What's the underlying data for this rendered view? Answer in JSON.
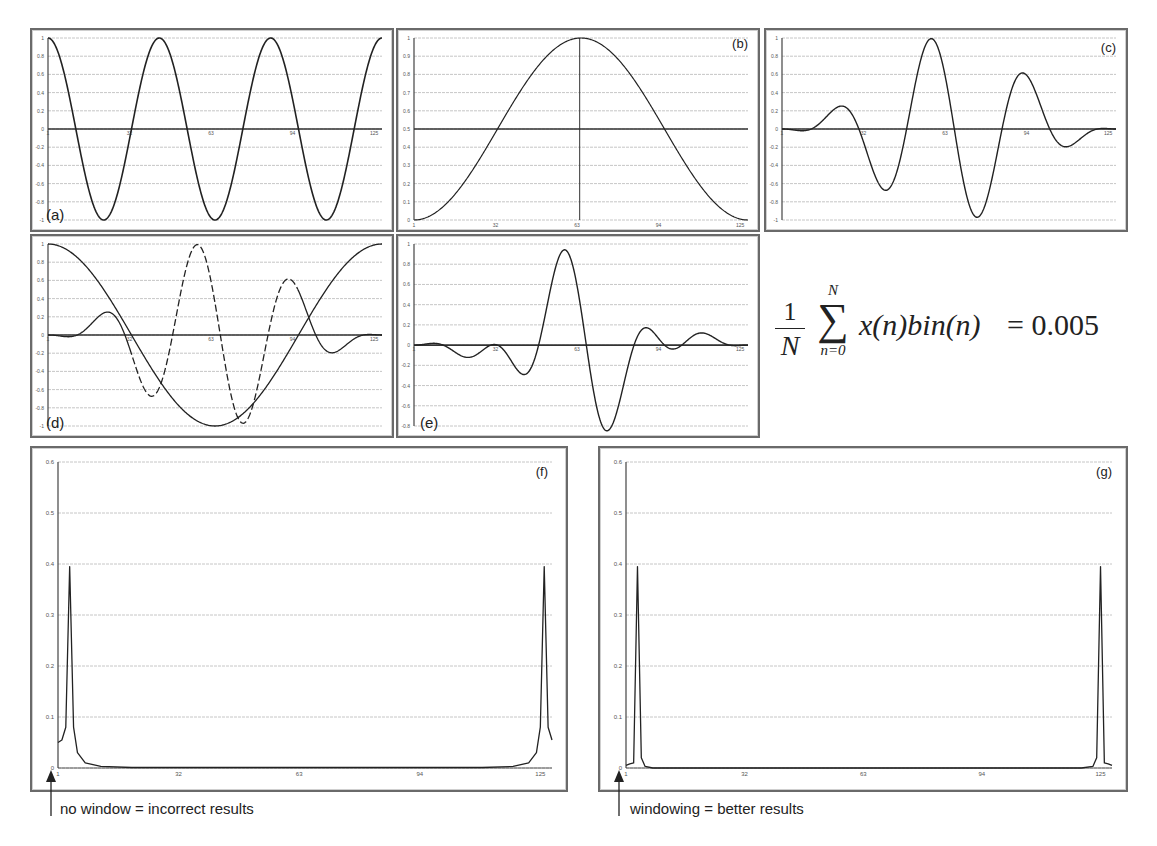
{
  "figure": {
    "formula": {
      "prefix_num": "1",
      "prefix_den": "N",
      "sum_upper": "N",
      "sum_lower": "n=0",
      "body": "x(n)bin(n)",
      "equals": "= 0.005"
    },
    "annotations": {
      "f": "no window = incorrect results",
      "g": "windowing = better results"
    }
  },
  "chart_data": [
    {
      "id": "a",
      "label": "(a)",
      "type": "line",
      "title": "",
      "xlabel": "",
      "ylabel": "",
      "xlim": [
        1,
        128
      ],
      "ylim": [
        -1,
        1
      ],
      "xticks": [
        "1",
        "32",
        "63",
        "94",
        "125"
      ],
      "yticks": [
        "1",
        "0.8",
        "0.6",
        "0.4",
        "0.2",
        "0",
        "-0.2",
        "-0.4",
        "-0.6",
        "-0.8",
        "-1"
      ],
      "series": [
        {
          "name": "cosine signal",
          "function": "cos(2*pi*3*(n-1)/127)",
          "style": "solid"
        }
      ],
      "grid": true
    },
    {
      "id": "b",
      "label": "(b)",
      "type": "line",
      "xlim": [
        1,
        128
      ],
      "ylim": [
        0,
        1
      ],
      "xticks": [
        "1",
        "32",
        "63",
        "94",
        "125"
      ],
      "yticks": [
        "1",
        "0.9",
        "0.8",
        "0.7",
        "0.6",
        "0.5",
        "0.4",
        "0.3",
        "0.2",
        "0.1",
        "0"
      ],
      "series": [
        {
          "name": "hann window",
          "function": "0.5-0.5*cos(2*pi*(n-1)/127)",
          "style": "solid"
        }
      ],
      "reference_lines": {
        "horizontal": 0.5,
        "vertical": 64
      },
      "grid": true
    },
    {
      "id": "c",
      "label": "(c)",
      "type": "line",
      "xlim": [
        1,
        128
      ],
      "ylim": [
        -1,
        1
      ],
      "xticks": [
        "1",
        "32",
        "63",
        "94",
        "125"
      ],
      "yticks": [
        "1",
        "0.8",
        "0.6",
        "0.4",
        "0.2",
        "0",
        "-0.2",
        "-0.4",
        "-0.6",
        "-0.8",
        "-1"
      ],
      "series": [
        {
          "name": "windowed test signal",
          "peaks": [
            0.02,
            -0.25,
            0.71,
            -0.97,
            0.87,
            -0.42,
            0.08
          ],
          "style": "solid"
        }
      ],
      "grid": true
    },
    {
      "id": "d",
      "label": "(d)",
      "type": "line",
      "xlim": [
        1,
        128
      ],
      "ylim": [
        -1,
        1
      ],
      "xticks": [
        "1",
        "32",
        "63",
        "94",
        "125"
      ],
      "yticks": [
        "1",
        "0.8",
        "0.6",
        "0.4",
        "0.2",
        "0",
        "-0.2",
        "-0.4",
        "-0.6",
        "-0.8",
        "-1"
      ],
      "series": [
        {
          "name": "windowed test signal",
          "style": "solid/dashed",
          "peaks": [
            0.02,
            -0.25,
            0.71,
            -0.97,
            0.87,
            -0.42,
            0.08
          ]
        },
        {
          "name": "frequency bin cosine",
          "function": "cos(2*pi*(n-1)/127)",
          "style": "solid"
        }
      ],
      "grid": true
    },
    {
      "id": "e",
      "label": "(e)",
      "type": "line",
      "xlim": [
        1,
        128
      ],
      "ylim": [
        -0.8,
        1
      ],
      "xticks": [
        "1",
        "32",
        "63",
        "94",
        "125"
      ],
      "yticks": [
        "1",
        "0.8",
        "0.6",
        "0.4",
        "0.2",
        "0",
        "-0.2",
        "-0.4",
        "-0.6",
        "-0.8"
      ],
      "series": [
        {
          "name": "product x(n)bin(n)",
          "peaks": [
            0.02,
            -0.12,
            0.0,
            -0.35,
            0.97,
            -0.65,
            0.04,
            -0.1,
            0.07
          ],
          "style": "solid"
        }
      ],
      "grid": true
    },
    {
      "id": "f",
      "label": "(f)",
      "type": "line",
      "xlim": [
        1,
        128
      ],
      "ylim": [
        0,
        0.6
      ],
      "xticks": [
        "1",
        "32",
        "63",
        "94",
        "125"
      ],
      "yticks": [
        "0.6",
        "0.5",
        "0.4",
        "0.3",
        "0.2",
        "0.1",
        "0"
      ],
      "series": [
        {
          "name": "spectrum (no window)",
          "x": [
            1,
            2,
            3,
            4,
            5,
            6,
            8,
            12,
            20,
            110,
            118,
            122,
            124,
            125,
            126,
            127,
            128
          ],
          "values": [
            0.05,
            0.055,
            0.08,
            0.395,
            0.08,
            0.03,
            0.01,
            0.003,
            0.001,
            0.001,
            0.003,
            0.01,
            0.03,
            0.08,
            0.395,
            0.08,
            0.055
          ]
        }
      ],
      "grid": true
    },
    {
      "id": "g",
      "label": "(g)",
      "type": "line",
      "xlim": [
        1,
        128
      ],
      "ylim": [
        0,
        0.6
      ],
      "xticks": [
        "1",
        "32",
        "63",
        "94",
        "125"
      ],
      "yticks": [
        "0.6",
        "0.5",
        "0.4",
        "0.3",
        "0.2",
        "0.1",
        "0"
      ],
      "series": [
        {
          "name": "spectrum (hann window)",
          "x": [
            1,
            2,
            3,
            4,
            5,
            6,
            8,
            120,
            123,
            124,
            125,
            126,
            127,
            128
          ],
          "values": [
            0.005,
            0.008,
            0.01,
            0.395,
            0.02,
            0.003,
            0.0,
            0.0,
            0.003,
            0.02,
            0.395,
            0.01,
            0.008,
            0.005
          ]
        }
      ],
      "grid": true
    }
  ]
}
